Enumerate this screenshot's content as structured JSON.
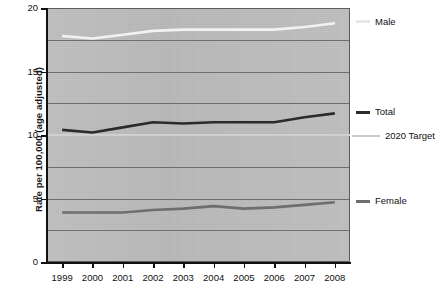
{
  "chart_data": {
    "type": "line",
    "title": "",
    "xlabel": "",
    "ylabel": "Rate per 100,000 (age adjusted)",
    "categories": [
      "1999",
      "2000",
      "2001",
      "2002",
      "2003",
      "2004",
      "2005",
      "2006",
      "2007",
      "2008"
    ],
    "x": [
      1999,
      2000,
      2001,
      2002,
      2003,
      2004,
      2005,
      2006,
      2007,
      2008
    ],
    "xlim": [
      1998.5,
      2008.5
    ],
    "ylim": [
      0,
      20
    ],
    "yticks": [
      0,
      5,
      10,
      15,
      20
    ],
    "ytick_labels": [
      "0",
      "5",
      "10",
      "15",
      "20"
    ],
    "gridlines_y": [
      2.5,
      5,
      7.5,
      10,
      12.5,
      15,
      17.5
    ],
    "grid": true,
    "legend_position": "right",
    "series": [
      {
        "name": "Male",
        "color": "#f2f2f2",
        "width": 2.6,
        "values": [
          17.8,
          17.6,
          17.9,
          18.2,
          18.3,
          18.3,
          18.3,
          18.3,
          18.5,
          18.8
        ]
      },
      {
        "name": "Total",
        "color": "#2b2b2b",
        "width": 2.6,
        "values": [
          10.4,
          10.2,
          10.6,
          11.0,
          10.9,
          11.0,
          11.0,
          11.0,
          11.4,
          11.7
        ]
      },
      {
        "name": "Female",
        "color": "#6e6e6e",
        "width": 2.6,
        "values": [
          3.9,
          3.9,
          3.9,
          4.1,
          4.2,
          4.4,
          4.2,
          4.3,
          4.5,
          4.7
        ]
      }
    ],
    "reference_lines": [
      {
        "name": "2020 Target",
        "color": "#cfcfcf",
        "width": 2.0,
        "value": 10.0
      }
    ],
    "plot_background": "#bdbdbd",
    "gridline_color": "#6e6e6e",
    "axis_color": "#111111"
  },
  "legend": {
    "items": [
      {
        "label": "Male",
        "color": "#e8e8e8",
        "style": "line"
      },
      {
        "label": "Total",
        "color": "#2b2b2b",
        "style": "line"
      },
      {
        "label": "2020 Target",
        "color": "#c9c9c9",
        "style": "thin"
      },
      {
        "label": "Female",
        "color": "#6e6e6e",
        "style": "line"
      }
    ]
  }
}
